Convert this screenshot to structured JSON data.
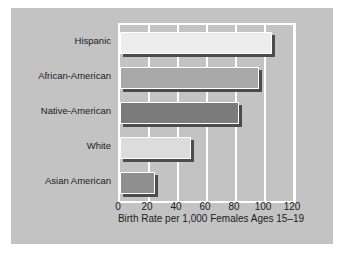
{
  "chart_data": {
    "type": "bar",
    "orientation": "horizontal",
    "title": "",
    "xlabel": "Birth Rate per 1,000 Females Ages 15–19",
    "ylabel": "",
    "categories": [
      "Hispanic",
      "African-American",
      "Native-American",
      "White",
      "Asian American"
    ],
    "values": [
      105,
      96,
      82,
      49,
      24
    ],
    "xlim": [
      0,
      120
    ],
    "xticks": [
      0,
      20,
      40,
      60,
      80,
      100,
      120
    ],
    "xtick_labels": [
      "0",
      "20",
      "40",
      "60",
      "80",
      "100",
      "120"
    ],
    "grid": "vertical-white",
    "legend": "none",
    "bar_colors": [
      "#ededed",
      "#a8a8a8",
      "#7b7b7b",
      "#dcdcdc",
      "#8f8f8f"
    ],
    "panel_color": "#c3c3c3",
    "gridline_color": "#ffffff",
    "shadow_color": "#4c4c4c",
    "page_color": "#ffffff"
  }
}
